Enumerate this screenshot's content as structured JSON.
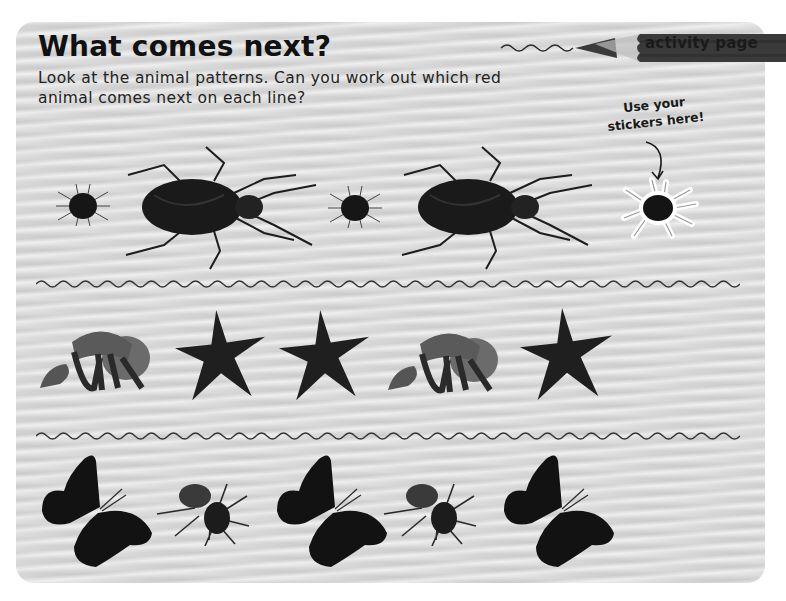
{
  "page": {
    "title": "What comes next?",
    "instructions": "Look at the animal patterns. Can you work out which red animal comes next on each line?",
    "badge_label": "activity page",
    "sticker_hint": "Use your stickers here!"
  },
  "rows": [
    {
      "name": "bugs-row",
      "items": [
        {
          "animal": "spider",
          "kind": "mite-icon"
        },
        {
          "animal": "beetle",
          "kind": "beetle-icon"
        },
        {
          "animal": "spider",
          "kind": "mite-icon"
        },
        {
          "animal": "beetle",
          "kind": "beetle-icon"
        },
        {
          "animal": "spider sticker",
          "kind": "mite-sticker-icon"
        }
      ]
    },
    {
      "name": "sea-row",
      "items": [
        {
          "animal": "hermit crab",
          "kind": "hermit-crab-icon"
        },
        {
          "animal": "starfish",
          "kind": "starfish-icon"
        },
        {
          "animal": "starfish",
          "kind": "starfish-icon"
        },
        {
          "animal": "hermit crab",
          "kind": "hermit-crab-icon"
        },
        {
          "animal": "starfish",
          "kind": "starfish-icon"
        }
      ]
    },
    {
      "name": "flying-row",
      "items": [
        {
          "animal": "butterfly",
          "kind": "butterfly-icon"
        },
        {
          "animal": "bee",
          "kind": "bee-icon"
        },
        {
          "animal": "butterfly",
          "kind": "butterfly-icon"
        },
        {
          "animal": "bee",
          "kind": "bee-icon"
        },
        {
          "animal": "butterfly",
          "kind": "butterfly-icon"
        }
      ]
    }
  ],
  "colors": {
    "card_bg": "#d6d6d6",
    "ink": "#111111",
    "pencil_body": "#3a3a3a"
  }
}
